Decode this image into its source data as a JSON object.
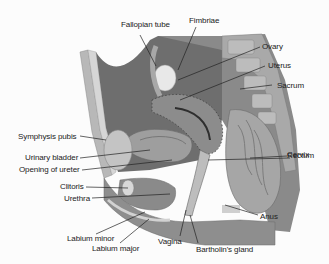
{
  "diagram": {
    "labels": {
      "fallopian_tube": "Fallopian tube",
      "fimbriae": "Fimbriae",
      "ovary": "Ovary",
      "uterus": "Uterus",
      "sacrum": "Sacrum",
      "symphysis_pubis": "Symphysis pubis",
      "cervix": "Cervix",
      "urinary_bladder": "Urinary bladder",
      "rectum": "Rectum",
      "opening_of_ureter": "Opening of ureter",
      "clitoris": "Clitoris",
      "urethra": "Urethra",
      "anus": "Anus",
      "labium_minor": "Labium minor",
      "labium_major": "Labium major",
      "vagina": "Vagina",
      "bartholins_gland": "Bartholin's gland"
    },
    "colors": {
      "tissue_dark": "#6f6f6f",
      "tissue_mid": "#9a9a9a",
      "tissue_light": "#c8c8c8",
      "bone": "#b4b4b4",
      "highlight": "#e6e6e6",
      "leader": "#222222"
    }
  }
}
